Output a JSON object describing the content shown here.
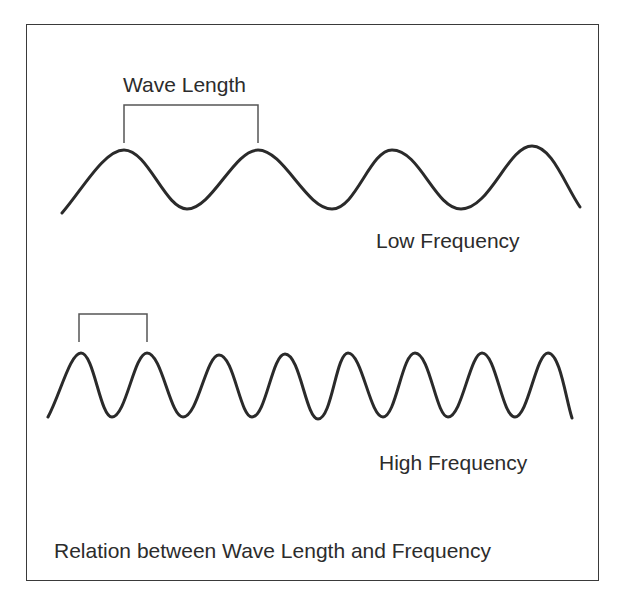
{
  "diagram": {
    "title": "Relation between Wave Length and Frequency",
    "wavelength_label": "Wave Length",
    "low_wave": {
      "label": "Low Frequency",
      "cycles_shown": 4,
      "peaks_x": [
        124,
        258,
        392,
        532
      ]
    },
    "high_wave": {
      "label": "High Frequency",
      "cycles_shown": 8,
      "peaks_x": [
        81,
        147,
        219,
        285,
        348,
        415,
        482,
        548
      ]
    },
    "colors": {
      "stroke": "#2a2a2a",
      "bracket": "#555555",
      "background": "#ffffff"
    }
  }
}
